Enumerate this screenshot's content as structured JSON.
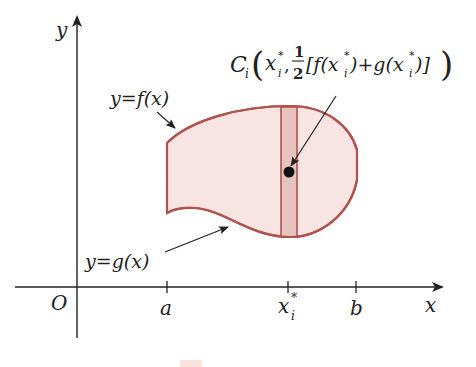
{
  "diagram": {
    "type": "region-between-curves",
    "axes": {
      "x_label": "x",
      "y_label": "y",
      "origin_label": "O"
    },
    "ticks": {
      "a": "a",
      "xi_star": "x",
      "xi_star_sub": "i",
      "xi_star_sup": "*",
      "b": "b"
    },
    "curves": {
      "top_label": "y=f(x)",
      "bottom_label": "y=g(x)"
    },
    "centroid_label": {
      "C": "C",
      "C_sub": "i",
      "open": "(",
      "x": "x",
      "x_sub": "i",
      "x_sup": "*",
      "comma": ",",
      "frac_num": "1",
      "frac_den": "2",
      "bracket_expr_1": "[f(x",
      "bracket_expr_2": ")+g(x",
      "bracket_expr_3": ")]",
      "sub_i": "i",
      "sup_star": "*",
      "close": ")"
    },
    "colors": {
      "region_fill": "#f8e4e2",
      "region_stroke": "#b0534f",
      "strip_fill": "#e7c3bf",
      "axis": "#222222",
      "dot": "#111111"
    }
  }
}
